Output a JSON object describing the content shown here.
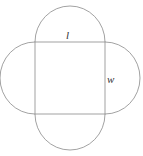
{
  "diagram": {
    "labels": {
      "length": "l",
      "width": "w"
    },
    "colors": {
      "stroke": "#8a8a8a",
      "text": "#333333",
      "background": "#ffffff"
    }
  }
}
